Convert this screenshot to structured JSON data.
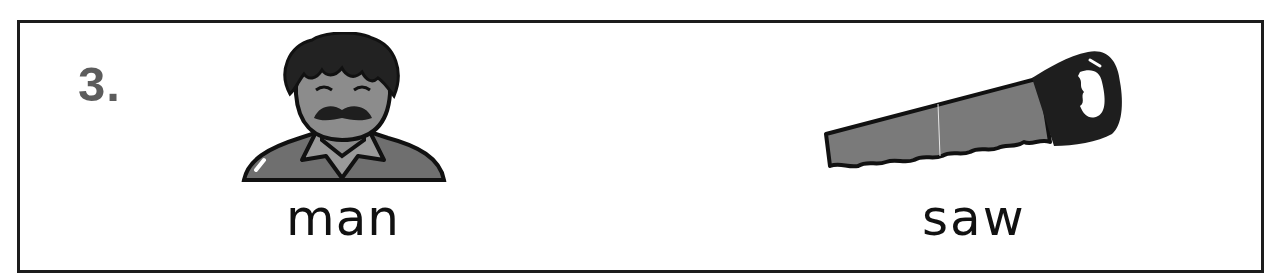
{
  "card": {
    "number": "3.",
    "items": [
      {
        "word": "man",
        "picture": "man-portrait-icon"
      },
      {
        "word": "saw",
        "picture": "hand-saw-icon"
      }
    ]
  },
  "colors": {
    "border": "#1c1c1c",
    "number": "#5c5c5c",
    "text": "#111111",
    "fill_gray": "#7a7a7a",
    "fill_dark": "#1e1e1e"
  }
}
